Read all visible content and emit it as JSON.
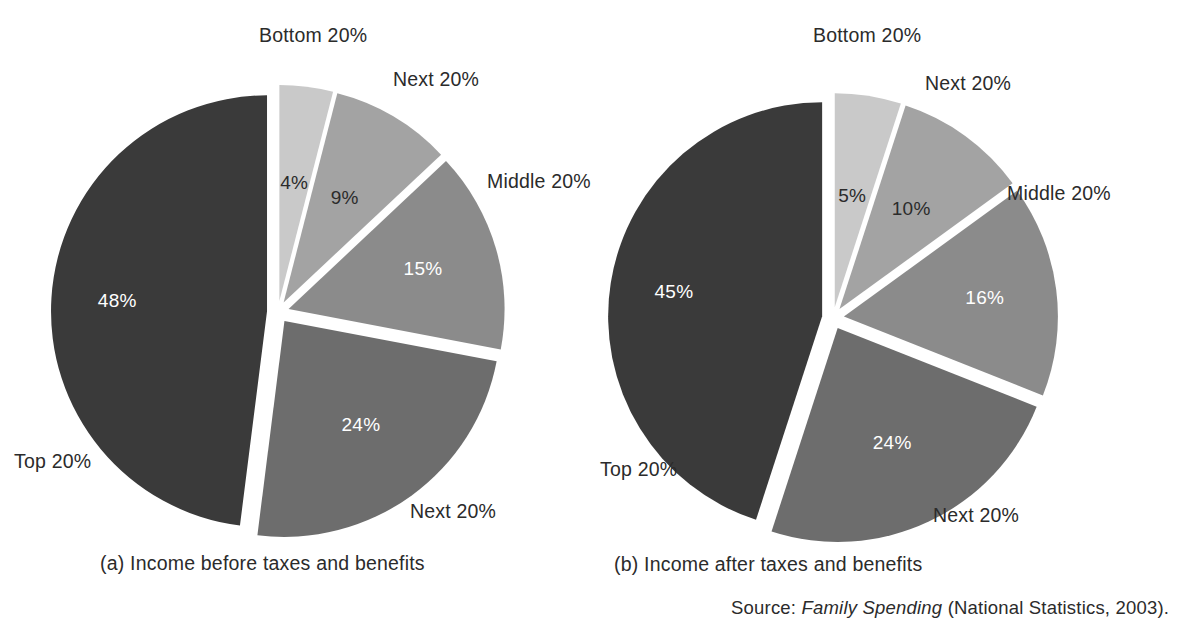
{
  "figure": {
    "background": "#ffffff",
    "text_color": "#2b2b2b"
  },
  "source": {
    "prefix": "Source:",
    "title": "Family Spending",
    "suffix": "(National Statistics, 2003)."
  },
  "palette": {
    "bottom20": "#c9c9c9",
    "next20_lower": "#a3a3a3",
    "middle20": "#8b8b8b",
    "next20_upper": "#6d6d6d",
    "top20": "#3a3a3a"
  },
  "chart_data": [
    {
      "type": "pie",
      "id": "a",
      "title": "(a) Income before taxes and benefits",
      "caption": "(a) Income before taxes and benefits",
      "unit": "%",
      "exploded": true,
      "legend": "labels placed outside slices",
      "categories": [
        "Bottom 20%",
        "Next 20%",
        "Middle 20%",
        "Next 20%",
        "Top 20%"
      ],
      "values": [
        4,
        9,
        15,
        24,
        48
      ],
      "value_labels": [
        "4%",
        "9%",
        "15%",
        "24%",
        "48%"
      ],
      "slices": [
        {
          "label": "Bottom 20%",
          "value": 4,
          "value_label": "4%",
          "color": "#c9c9c9",
          "text_on": "dark-text"
        },
        {
          "label": "Next 20%",
          "value": 9,
          "value_label": "9%",
          "color": "#a3a3a3",
          "text_on": "dark-text"
        },
        {
          "label": "Middle 20%",
          "value": 15,
          "value_label": "15%",
          "color": "#8b8b8b",
          "text_on": "light-text"
        },
        {
          "label": "Next 20%",
          "value": 24,
          "value_label": "24%",
          "color": "#6d6d6d",
          "text_on": "light-text"
        },
        {
          "label": "Top 20%",
          "value": 48,
          "value_label": "48%",
          "color": "#3a3a3a",
          "text_on": "light-text"
        }
      ]
    },
    {
      "type": "pie",
      "id": "b",
      "title": "(b) Income after taxes and benefits",
      "caption": "(b) Income after taxes and benefits",
      "unit": "%",
      "exploded": true,
      "legend": "labels placed outside slices",
      "categories": [
        "Bottom 20%",
        "Next 20%",
        "Middle 20%",
        "Next 20%",
        "Top 20%"
      ],
      "values": [
        5,
        10,
        16,
        24,
        45
      ],
      "value_labels": [
        "5%",
        "10%",
        "16%",
        "24%",
        "45%"
      ],
      "slices": [
        {
          "label": "Bottom 20%",
          "value": 5,
          "value_label": "5%",
          "color": "#c9c9c9",
          "text_on": "dark-text"
        },
        {
          "label": "Next 20%",
          "value": 10,
          "value_label": "10%",
          "color": "#a3a3a3",
          "text_on": "dark-text"
        },
        {
          "label": "Middle 20%",
          "value": 16,
          "value_label": "16%",
          "color": "#8b8b8b",
          "text_on": "light-text"
        },
        {
          "label": "Next 20%",
          "value": 24,
          "value_label": "24%",
          "color": "#6d6d6d",
          "text_on": "light-text"
        },
        {
          "label": "Top 20%",
          "value": 45,
          "value_label": "45%",
          "color": "#3a3a3a",
          "text_on": "light-text"
        }
      ]
    }
  ],
  "chart_a": {
    "caption": "(a) Income before taxes and benefits",
    "labels": {
      "bottom20": "Bottom 20%",
      "next20_lower": "Next 20%",
      "middle20": "Middle 20%",
      "next20_upper": "Next 20%",
      "top20": "Top 20%"
    },
    "values": {
      "bottom20": "4%",
      "next20_lower": "9%",
      "middle20": "15%",
      "next20_upper": "24%",
      "top20": "48%"
    }
  },
  "chart_b": {
    "caption": "(b) Income after taxes and benefits",
    "labels": {
      "bottom20": "Bottom 20%",
      "next20_lower": "Next 20%",
      "middle20": "Middle 20%",
      "next20_upper": "Next 20%",
      "top20": "Top 20%"
    },
    "values": {
      "bottom20": "5%",
      "next20_lower": "10%",
      "middle20": "16%",
      "next20_upper": "24%",
      "top20": "45%"
    }
  }
}
